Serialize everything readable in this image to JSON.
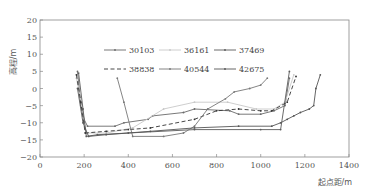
{
  "chart_data": {
    "type": "line",
    "title": "",
    "xlabel": "起点距/m",
    "ylabel": "高程/m",
    "xlim": [
      0,
      1400
    ],
    "ylim": [
      -20,
      20
    ],
    "xticks": [
      0,
      200,
      400,
      600,
      800,
      1000,
      1200,
      1400
    ],
    "yticks": [
      20,
      15,
      10,
      5,
      0,
      -5,
      -10,
      -15,
      -20
    ],
    "grid": false,
    "legend_position": "upper center (inside plot, 2 rows x 3 columns)",
    "series": [
      {
        "name": "30103",
        "color": "#6a6a6a",
        "dash": "solid",
        "points": [
          [
            170,
            5
          ],
          [
            185,
            -5
          ],
          [
            200,
            -9
          ],
          [
            215,
            -11
          ],
          [
            340,
            -11
          ],
          [
            380,
            -10
          ],
          [
            490,
            -9
          ],
          [
            510,
            -8
          ],
          [
            650,
            -7
          ],
          [
            700,
            -6
          ],
          [
            860,
            -6.5
          ],
          [
            900,
            -7.5
          ],
          [
            1000,
            -7.5
          ],
          [
            1060,
            -6.5
          ],
          [
            1110,
            -5
          ],
          [
            1130,
            3
          ]
        ]
      },
      {
        "name": "36161",
        "color": "#c8c8c8",
        "dash": "solid",
        "points": [
          [
            165,
            3
          ],
          [
            190,
            -5
          ],
          [
            210,
            -13
          ],
          [
            300,
            -13
          ],
          [
            420,
            -11.5
          ],
          [
            560,
            -6
          ],
          [
            700,
            -4
          ],
          [
            850,
            -4
          ],
          [
            980,
            -6
          ],
          [
            1060,
            -6
          ],
          [
            1110,
            -4
          ],
          [
            1150,
            4
          ]
        ]
      },
      {
        "name": "37469",
        "color": "#5a5a5a",
        "dash": "solid",
        "points": [
          [
            175,
            4.5
          ],
          [
            195,
            -6
          ],
          [
            210,
            -14
          ],
          [
            260,
            -13.5
          ],
          [
            400,
            -13
          ],
          [
            700,
            -12
          ],
          [
            1000,
            -12
          ],
          [
            1090,
            -12
          ],
          [
            1130,
            5
          ]
        ]
      },
      {
        "name": "38838",
        "color": "#333333",
        "dash": "dashed",
        "points": [
          [
            165,
            4
          ],
          [
            185,
            -4
          ],
          [
            205,
            -13
          ],
          [
            300,
            -12.5
          ],
          [
            400,
            -12
          ],
          [
            500,
            -11.5
          ],
          [
            700,
            -9
          ],
          [
            800,
            -6.5
          ],
          [
            900,
            -6
          ],
          [
            1000,
            -6.5
          ],
          [
            1050,
            -6.5
          ],
          [
            1120,
            -4
          ],
          [
            1160,
            3.5
          ]
        ]
      },
      {
        "name": "40544",
        "color": "#777777",
        "dash": "solid",
        "points": [
          [
            350,
            3
          ],
          [
            380,
            -4
          ],
          [
            420,
            -14
          ],
          [
            560,
            -14
          ],
          [
            650,
            -13
          ],
          [
            700,
            -11
          ],
          [
            760,
            -6
          ],
          [
            840,
            -3
          ],
          [
            880,
            -1
          ],
          [
            950,
            0
          ],
          [
            1000,
            1
          ],
          [
            1030,
            3
          ]
        ]
      },
      {
        "name": "42675",
        "color": "#555555",
        "dash": "solid",
        "points": [
          [
            170,
            0
          ],
          [
            195,
            -10
          ],
          [
            220,
            -14
          ],
          [
            300,
            -13.5
          ],
          [
            500,
            -12.5
          ],
          [
            700,
            -11.5
          ],
          [
            900,
            -11
          ],
          [
            1050,
            -11
          ],
          [
            1090,
            -10
          ],
          [
            1120,
            -9
          ],
          [
            1150,
            -8
          ],
          [
            1180,
            -7
          ],
          [
            1220,
            -6
          ],
          [
            1240,
            -5
          ],
          [
            1250,
            0
          ],
          [
            1270,
            4
          ]
        ]
      }
    ]
  }
}
